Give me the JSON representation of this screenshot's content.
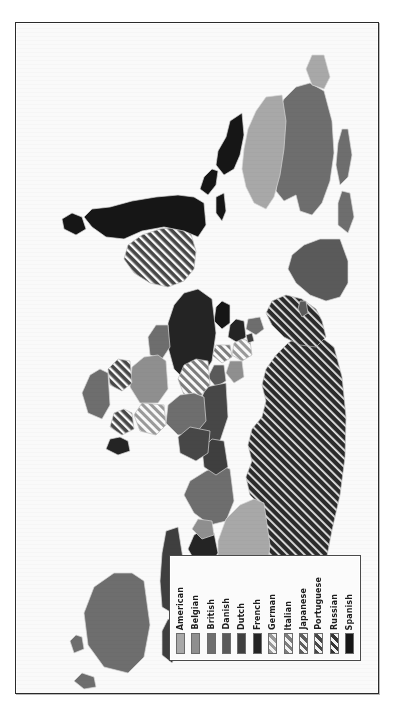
{
  "figure": {
    "type": "choropleth-map",
    "orientation_degrees": 90,
    "background_color": "#fafafa",
    "frame_color": "#2a2a2a"
  },
  "legend": {
    "position": "bottom-right",
    "label_orientation": "vertical",
    "entries": [
      {
        "label": "American",
        "color": "#a8a8a8",
        "pattern": "solid"
      },
      {
        "label": "Belgian",
        "color": "#8f8f8f",
        "pattern": "solid"
      },
      {
        "label": "British",
        "color": "#6e6e6e",
        "pattern": "solid"
      },
      {
        "label": "Danish",
        "color": "#5a5a5a",
        "pattern": "solid"
      },
      {
        "label": "Dutch",
        "color": "#3f3f3f",
        "pattern": "solid"
      },
      {
        "label": "French",
        "color": "#242424",
        "pattern": "solid"
      },
      {
        "label": "German",
        "color": "#9a9a9a",
        "pattern": "hatch"
      },
      {
        "label": "Italian",
        "color": "#7d7d7d",
        "pattern": "hatch"
      },
      {
        "label": "Japanese",
        "color": "#5e5e5e",
        "pattern": "hatch"
      },
      {
        "label": "Portuguese",
        "color": "#474747",
        "pattern": "hatch"
      },
      {
        "label": "Russian",
        "color": "#333333",
        "pattern": "hatch"
      },
      {
        "label": "Spanish",
        "color": "#161616",
        "pattern": "solid"
      }
    ]
  },
  "chart_data": {
    "type": "map",
    "title": "",
    "legend_position": "bottom-right",
    "categories": [
      "American",
      "Belgian",
      "British",
      "Danish",
      "Dutch",
      "French",
      "German",
      "Italian",
      "Japanese",
      "Portuguese",
      "Russian",
      "Spanish"
    ],
    "regions": [
      {
        "name": "Russian Empire",
        "category": "Russian",
        "shade": "#333333",
        "pattern": "hatch"
      },
      {
        "name": "Greenland",
        "category": "Danish",
        "shade": "#5a5a5a",
        "pattern": "solid"
      },
      {
        "name": "Canada",
        "category": "British",
        "shade": "#6e6e6e",
        "pattern": "solid"
      },
      {
        "name": "United States",
        "category": "American",
        "shade": "#a8a8a8",
        "pattern": "solid"
      },
      {
        "name": "China",
        "category": "American",
        "shade": "#a8a8a8",
        "pattern": "solid"
      },
      {
        "name": "Japan / Korea",
        "category": "Japanese",
        "shade": "#5e5e5e",
        "pattern": "hatch"
      },
      {
        "name": "India",
        "category": "British",
        "shade": "#6e6e6e",
        "pattern": "solid"
      },
      {
        "name": "Indochina",
        "category": "French",
        "shade": "#242424",
        "pattern": "solid"
      },
      {
        "name": "Dutch East Indies",
        "category": "Dutch",
        "shade": "#3f3f3f",
        "pattern": "solid"
      },
      {
        "name": "Philippines",
        "category": "American",
        "shade": "#a8a8a8",
        "pattern": "solid"
      },
      {
        "name": "Australia",
        "category": "British",
        "shade": "#6e6e6e",
        "pattern": "solid"
      },
      {
        "name": "New Zealand",
        "category": "British",
        "shade": "#6e6e6e",
        "pattern": "solid"
      },
      {
        "name": "North Africa",
        "category": "French",
        "shade": "#242424",
        "pattern": "solid"
      },
      {
        "name": "Libya",
        "category": "Italian",
        "shade": "#7d7d7d",
        "pattern": "hatch"
      },
      {
        "name": "Egypt / Sudan",
        "category": "British",
        "shade": "#6e6e6e",
        "pattern": "solid"
      },
      {
        "name": "West Africa",
        "category": "French",
        "shade": "#242424",
        "pattern": "solid"
      },
      {
        "name": "Nigeria",
        "category": "British",
        "shade": "#6e6e6e",
        "pattern": "solid"
      },
      {
        "name": "Congo",
        "category": "Belgian",
        "shade": "#8f8f8f",
        "pattern": "solid"
      },
      {
        "name": "Angola / Mozambique",
        "category": "Portuguese",
        "shade": "#474747",
        "pattern": "hatch"
      },
      {
        "name": "South Africa",
        "category": "British",
        "shade": "#6e6e6e",
        "pattern": "solid"
      },
      {
        "name": "German East Africa",
        "category": "German",
        "shade": "#9a9a9a",
        "pattern": "hatch"
      },
      {
        "name": "Brazil",
        "category": "Portuguese",
        "shade": "#474747",
        "pattern": "hatch"
      },
      {
        "name": "Spanish America",
        "category": "Spanish",
        "shade": "#161616",
        "pattern": "solid"
      },
      {
        "name": "Greenland Sea islands",
        "category": "Danish",
        "shade": "#5a5a5a",
        "pattern": "solid"
      }
    ]
  }
}
